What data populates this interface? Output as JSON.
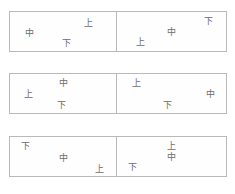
{
  "figure": {
    "kind": "character-position-grid",
    "background_color": "#ffffff",
    "border_color": "#b9b9b9",
    "text_color": "#6d6d6d",
    "rows": [
      {
        "id": "row-1",
        "cells": [
          {
            "id": "row-1-left",
            "glyphs": [
              {
                "text": "上",
                "x": 74,
                "y": 27
              },
              {
                "text": "中",
                "x": 18,
                "y": 53
              },
              {
                "text": "下",
                "x": 53,
                "y": 80
              }
            ]
          },
          {
            "id": "row-1-right",
            "glyphs": [
              {
                "text": "下",
                "x": 84,
                "y": 22
              },
              {
                "text": "中",
                "x": 50,
                "y": 50
              },
              {
                "text": "上",
                "x": 22,
                "y": 78
              }
            ]
          }
        ]
      },
      {
        "id": "row-2",
        "cells": [
          {
            "id": "row-2-left",
            "glyphs": [
              {
                "text": "中",
                "x": 50,
                "y": 22
              },
              {
                "text": "上",
                "x": 17,
                "y": 52
              },
              {
                "text": "下",
                "x": 49,
                "y": 80
              }
            ]
          },
          {
            "id": "row-2-right",
            "glyphs": [
              {
                "text": "上",
                "x": 18,
                "y": 22
              },
              {
                "text": "中",
                "x": 86,
                "y": 52
              },
              {
                "text": "下",
                "x": 46,
                "y": 80
              }
            ]
          }
        ]
      },
      {
        "id": "row-3",
        "cells": [
          {
            "id": "row-3-left",
            "glyphs": [
              {
                "text": "下",
                "x": 15,
                "y": 22
              },
              {
                "text": "中",
                "x": 50,
                "y": 53
              },
              {
                "text": "上",
                "x": 84,
                "y": 82
              }
            ]
          },
          {
            "id": "row-3-right",
            "glyphs": [
              {
                "text": "上",
                "x": 50,
                "y": 24
              },
              {
                "text": "中",
                "x": 50,
                "y": 50
              },
              {
                "text": "下",
                "x": 14,
                "y": 77
              }
            ]
          }
        ]
      }
    ]
  }
}
